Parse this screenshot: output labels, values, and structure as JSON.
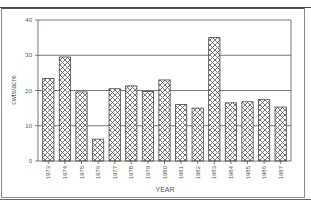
{
  "chart_data": {
    "type": "bar",
    "title": "",
    "xlabel": "YEAR",
    "ylabel": "cwts/acre",
    "ylim": [
      0,
      40
    ],
    "yticks": [
      0,
      10,
      20,
      30,
      40
    ],
    "grid": true,
    "pattern": "crosshatch",
    "categories": [
      "1973",
      "1974",
      "1975",
      "1976",
      "1977",
      "1978",
      "1979",
      "1980",
      "1981",
      "1982",
      "1983",
      "1984",
      "1985",
      "1986",
      "1987"
    ],
    "values": [
      23.4,
      29.5,
      19.6,
      6.2,
      20.5,
      21.3,
      19.7,
      23.0,
      16.0,
      15.0,
      35.0,
      16.5,
      16.8,
      17.4,
      15.3
    ]
  },
  "colors": {
    "bar_stroke": "#444444",
    "hatch": "#555555",
    "grid": "#555555",
    "text": "#555555"
  }
}
